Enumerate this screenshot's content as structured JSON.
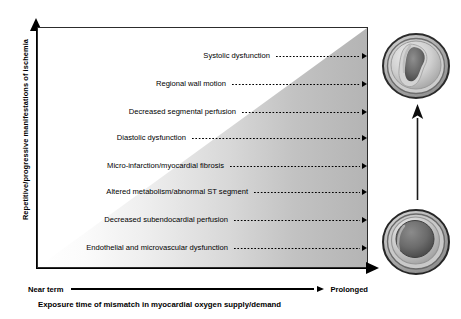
{
  "figure": {
    "type": "conceptual-gradient-diagram",
    "y_axis": {
      "label": "Repetitive/progressive manifestations of ischemia",
      "direction": "increasing-upward",
      "arrow": "up-arrow-icon"
    },
    "x_axis": {
      "start_label": "Near term",
      "end_label": "Prolonged",
      "caption": "Exposure time of mismatch in myocardial oxygen supply/demand",
      "direction": "increasing-rightward",
      "arrow": "right-arrow-icon"
    },
    "gradient": {
      "shape": "triangle-wedge",
      "from_color": "#ffffff",
      "to_color": "#b4b4b4",
      "note": "severity shading increases toward upper-right"
    },
    "rows": [
      {
        "label": "Systolic dysfunction",
        "order": 8,
        "severity": "highest"
      },
      {
        "label": "Regional wall motion",
        "order": 7,
        "severity": "very-high"
      },
      {
        "label": "Decreased segmental perfusion",
        "order": 6,
        "severity": "high"
      },
      {
        "label": "Diastolic dysfunction",
        "order": 5,
        "severity": "moderate-high"
      },
      {
        "label": "Micro-infarction/myocardial fibrosis",
        "order": 4,
        "severity": "moderate"
      },
      {
        "label": "Altered metabolism/abnormal ST segment",
        "order": 3,
        "severity": "moderate-low"
      },
      {
        "label": "Decreased subendocardial perfusion",
        "order": 2,
        "severity": "low"
      },
      {
        "label": "Endothelial and microvascular dysfunction",
        "order": 1,
        "severity": "lowest"
      }
    ],
    "illustrations": [
      {
        "name": "ventricle-cross-section-remodeled",
        "position": "top-right",
        "description": "left ventricular short-axis cross-section with asymmetric thickened wall and deformed cavity"
      },
      {
        "name": "ventricle-cross-section-normal",
        "position": "bottom-right",
        "description": "left ventricular short-axis cross-section with concentric wall and round cavity"
      }
    ],
    "progression_arrow": {
      "name": "progression-up-arrow",
      "from": "bottom-right illustration",
      "to": "top-right illustration"
    }
  },
  "colors": {
    "ink": "#000000",
    "frame": "#2c2c2c",
    "gradient_light": "#ffffff",
    "gradient_dark": "#b4b4b4"
  }
}
